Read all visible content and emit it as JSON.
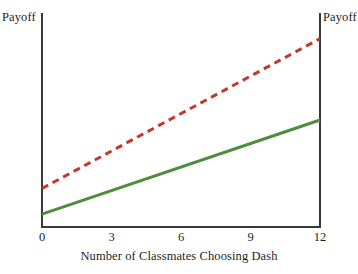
{
  "chart_data": {
    "type": "line",
    "title": "",
    "xlabel": "Number of Classmates Choosing Dash",
    "ylabel": "Payoff",
    "ylabel_right": "Payoff",
    "x": [
      0,
      12
    ],
    "xlim": [
      0,
      12
    ],
    "xticks": [
      0,
      3,
      6,
      9,
      12
    ],
    "xtick_labels": [
      "0",
      "3",
      "6",
      "9",
      "12"
    ],
    "ylim": [
      0,
      100
    ],
    "yticks": [],
    "ytick_labels": [],
    "grid": false,
    "legend": "none",
    "series": [
      {
        "name": "dashed-red-line",
        "style": "dashed",
        "color": "#c0392b",
        "width": 3,
        "dash_on": 7,
        "dash_off": 5,
        "x": [
          0,
          12
        ],
        "values": [
          18,
          88
        ]
      },
      {
        "name": "solid-green-line",
        "style": "solid",
        "color": "#4e8c3e",
        "width": 3,
        "x": [
          0,
          12
        ],
        "values": [
          6,
          50
        ]
      }
    ]
  },
  "axes": {
    "left_label": "Payoff",
    "right_label": "Payoff",
    "spine_color": "#3a3a3a"
  },
  "ticks": {
    "labels": [
      "0",
      "3",
      "6",
      "9",
      "12"
    ]
  },
  "xaxis": {
    "title": "Number of Classmates Choosing Dash"
  }
}
